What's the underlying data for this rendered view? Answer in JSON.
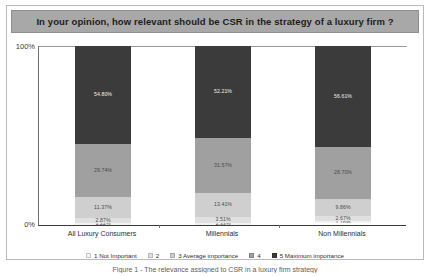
{
  "chart_data": {
    "type": "bar",
    "title": "In your opinion, how relevant should be CSR in the strategy of a luxury firm ?",
    "xlabel": "",
    "ylabel": "",
    "ylim": [
      0,
      100
    ],
    "grid": false,
    "legend_position": "bottom",
    "stacked": true,
    "stack_mode": "percent",
    "categories": [
      "All Luxury Consumers",
      "Millennials",
      "Non Millennials"
    ],
    "ytick_labels": [
      "100%",
      "0%"
    ],
    "series": [
      {
        "name": "1 Not Important",
        "color": "#f2f2f2",
        "values": [
          1.22,
          1.33,
          1.16
        ],
        "labels": [
          "1.22%",
          "1.33%",
          "1.16%"
        ]
      },
      {
        "name": "2",
        "color": "#e0e0e0",
        "values": [
          2.87,
          3.51,
          2.67
        ],
        "labels": [
          "2.87%",
          "3.51%",
          "2.67%"
        ]
      },
      {
        "name": "3 Average importance",
        "color": "#cfcfcf",
        "values": [
          11.37,
          13.41,
          9.86
        ],
        "labels": [
          "11.37%",
          "13.41%",
          "9.86%"
        ]
      },
      {
        "name": "4",
        "color": "#a0a0a0",
        "values": [
          29.74,
          31.57,
          28.7
        ],
        "labels": [
          "29.74%",
          "31.57%",
          "28.70%"
        ]
      },
      {
        "name": "5 Maximum importance",
        "color": "#3b3b3b",
        "values": [
          54.8,
          52.21,
          56.61
        ],
        "labels": [
          "54.80%",
          "52.21%",
          "56.61%"
        ]
      }
    ]
  },
  "caption": {
    "text": "Figure 1 - The relevance assigned to CSR in a luxury firm strategy"
  }
}
